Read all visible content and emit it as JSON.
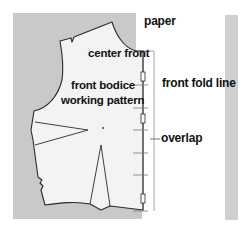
{
  "labels": {
    "paper": "paper",
    "center_front": "center front",
    "front_fold_line": "front fold line",
    "front_bodice_line1": "front bodice",
    "front_bodice_line2": "working pattern",
    "overlap": "overlap"
  },
  "colors": {
    "paper_gray": "#c9c9c9",
    "pattern_fill": "#f3f3f3",
    "line": "#2a2a2a",
    "strip_gray": "#cfcfcf",
    "guide_line": "#8a8a8a"
  }
}
